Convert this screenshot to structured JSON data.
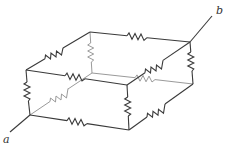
{
  "diagram": {
    "type": "resistor-cube-network",
    "terminals": [
      {
        "id": "a",
        "label": "a"
      },
      {
        "id": "b",
        "label": "b"
      }
    ],
    "colors": {
      "visible_wire": "#3a3a3a",
      "hidden_wire": "#9a9a9a",
      "background": "#ffffff"
    },
    "resistor_count": 12
  }
}
